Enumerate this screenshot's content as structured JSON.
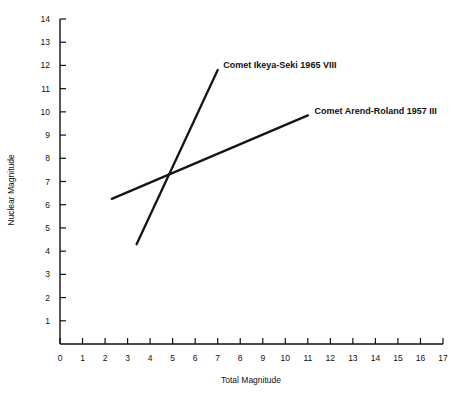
{
  "chart_data": {
    "type": "line",
    "title": "",
    "xlabel": "Total Magnitude",
    "ylabel": "Nuclear Magnitude",
    "xlim": [
      0,
      17
    ],
    "ylim": [
      0,
      14
    ],
    "xticks": [
      0,
      1,
      2,
      3,
      4,
      5,
      6,
      7,
      8,
      9,
      10,
      11,
      12,
      13,
      14,
      15,
      16,
      17
    ],
    "yticks": [
      1,
      2,
      3,
      4,
      5,
      6,
      7,
      8,
      9,
      10,
      11,
      12,
      13,
      14
    ],
    "xtick_labels": [
      "0",
      "1",
      "2",
      "3",
      "4",
      "5",
      "6",
      "7",
      "8",
      "9",
      "10",
      "11",
      "12",
      "13",
      "14",
      "15",
      "16",
      "17"
    ],
    "ytick_labels": [
      "1",
      "2",
      "3",
      "4",
      "5",
      "6",
      "7",
      "8",
      "9",
      "10",
      "11",
      "12",
      "13",
      "14"
    ],
    "grid": false,
    "legend_position": "inline-annotation",
    "line_color": "#151515",
    "series": [
      {
        "name": "Comet Ikeya-Seki 1965 VIII",
        "label": "Comet Ikeya-Seki 1965 VIII",
        "x": [
          3.4,
          7.0
        ],
        "values": [
          4.3,
          11.8
        ],
        "label_x": 7.25,
        "label_y": 12.0
      },
      {
        "name": "Comet Arend-Roland 1957 III",
        "label": "Comet Arend-Roland 1957 III",
        "x": [
          2.3,
          11.0
        ],
        "values": [
          6.25,
          9.85
        ],
        "label_x": 11.3,
        "label_y": 10.05
      }
    ]
  },
  "axes": {
    "x_axis_title": "Total Magnitude",
    "y_axis_title": "Nuclear Magnitude"
  }
}
